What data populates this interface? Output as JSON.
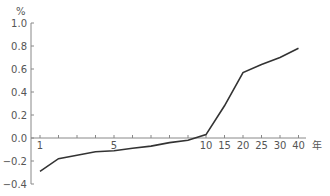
{
  "chart_data": {
    "type": "line",
    "title": "",
    "xlabel": "年",
    "ylabel": "%",
    "x_ticks": [
      "1",
      "5",
      "10",
      "15",
      "20",
      "25",
      "30",
      "40"
    ],
    "y_ticks": [
      "1.0",
      "0.8",
      "0.6",
      "0.4",
      "0.2",
      "0.0",
      "−0.2",
      "−0.4"
    ],
    "ylim": [
      -0.4,
      1.0
    ],
    "grid": false,
    "legend": null,
    "x": [
      1,
      2,
      3,
      4,
      5,
      6,
      7,
      8,
      9,
      10,
      15,
      20,
      25,
      30,
      40
    ],
    "series": [
      {
        "name": "rate",
        "values": [
          -0.29,
          -0.18,
          -0.15,
          -0.12,
          -0.11,
          -0.09,
          -0.07,
          -0.04,
          -0.02,
          0.03,
          0.28,
          0.57,
          0.64,
          0.7,
          0.78
        ],
        "color": "#333333"
      }
    ]
  }
}
